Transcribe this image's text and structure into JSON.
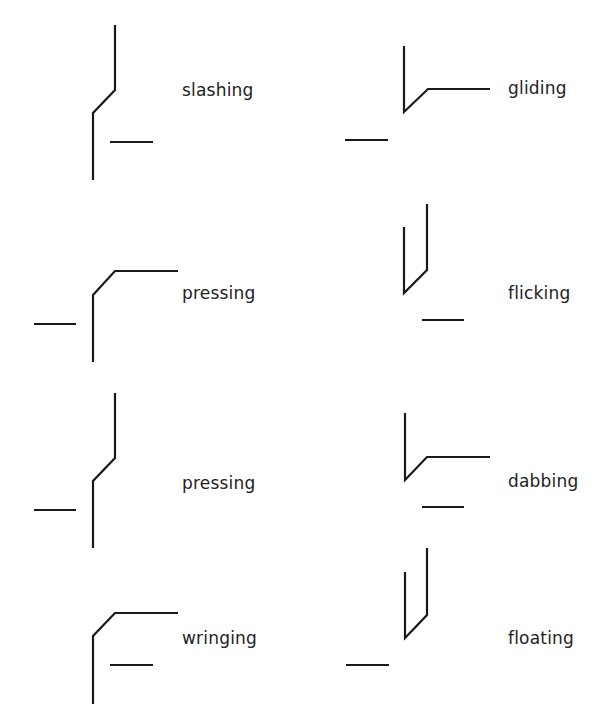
{
  "diagram": {
    "stroke_color": "#1a1a1a",
    "text_color": "#222222",
    "items": [
      {
        "label": "slashing",
        "label_pos": [
          182,
          82
        ],
        "paths": [
          [
            [
              115,
              25
            ],
            [
              115,
              90
            ],
            [
              93,
              113
            ],
            [
              93,
              180
            ]
          ],
          [
            [
              110,
              142
            ],
            [
              153,
              142
            ]
          ]
        ]
      },
      {
        "label": "gliding",
        "label_pos": [
          508,
          80
        ],
        "paths": [
          [
            [
              404,
              46
            ],
            [
              404,
              112
            ],
            [
              428,
              89
            ],
            [
              490,
              89
            ]
          ],
          [
            [
              345,
              140
            ],
            [
              388,
              140
            ]
          ]
        ]
      },
      {
        "label": "pressing",
        "label_pos": [
          182,
          285
        ],
        "paths": [
          [
            [
              178,
              271
            ],
            [
              115,
              271
            ],
            [
              93,
              295
            ],
            [
              93,
              362
            ]
          ],
          [
            [
              34,
              324
            ],
            [
              76,
              324
            ]
          ]
        ]
      },
      {
        "label": "flicking",
        "label_pos": [
          508,
          285
        ],
        "paths": [
          [
            [
              404,
              227
            ],
            [
              404,
              293
            ],
            [
              427,
              270
            ],
            [
              427,
              204
            ]
          ],
          [
            [
              422,
              320
            ],
            [
              464,
              320
            ]
          ]
        ]
      },
      {
        "label": "pressing",
        "label_pos": [
          182,
          475
        ],
        "paths": [
          [
            [
              115,
              393
            ],
            [
              115,
              458
            ],
            [
              93,
              481
            ],
            [
              93,
              548
            ]
          ],
          [
            [
              34,
              510
            ],
            [
              76,
              510
            ]
          ]
        ]
      },
      {
        "label": "dabbing",
        "label_pos": [
          508,
          473
        ],
        "paths": [
          [
            [
              405,
              413
            ],
            [
              405,
              480
            ],
            [
              427,
              457
            ],
            [
              490,
              457
            ]
          ],
          [
            [
              422,
              507
            ],
            [
              464,
              507
            ]
          ]
        ]
      },
      {
        "label": "wringing",
        "label_pos": [
          182,
          630
        ],
        "paths": [
          [
            [
              178,
              613
            ],
            [
              115,
              613
            ],
            [
              93,
              636
            ],
            [
              93,
              704
            ]
          ],
          [
            [
              110,
              665
            ],
            [
              153,
              665
            ]
          ]
        ]
      },
      {
        "label": "floating",
        "label_pos": [
          508,
          630
        ],
        "paths": [
          [
            [
              405,
              572
            ],
            [
              405,
              638
            ],
            [
              427,
              615
            ],
            [
              427,
              548
            ]
          ],
          [
            [
              346,
              665
            ],
            [
              389,
              665
            ]
          ]
        ]
      }
    ]
  }
}
